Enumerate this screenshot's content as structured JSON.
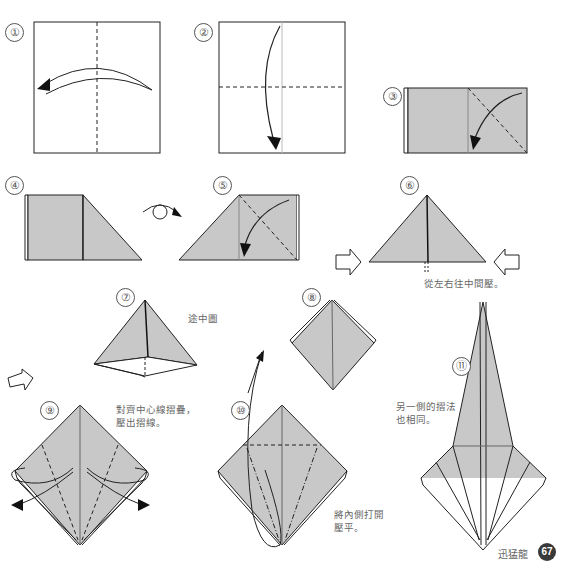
{
  "page": {
    "type": "origami instruction page",
    "paper_color": "#c8c8c8",
    "line_color": "#222222",
    "footer": {
      "title": "迅猛龍",
      "page_number": "67"
    }
  },
  "steps": [
    {
      "num": "①",
      "note": ""
    },
    {
      "num": "②",
      "note": ""
    },
    {
      "num": "③",
      "note": ""
    },
    {
      "num": "④",
      "note": ""
    },
    {
      "num": "⑤",
      "note": ""
    },
    {
      "num": "⑥",
      "note": "從左右往中間壓。"
    },
    {
      "num": "⑦",
      "note": "途中圖"
    },
    {
      "num": "⑧",
      "note": ""
    },
    {
      "num": "⑨",
      "note_line1": "對齊中心線摺疊，",
      "note_line2": "壓出摺線。"
    },
    {
      "num": "⑩",
      "note_line1": "將內側打開",
      "note_line2": "壓平。"
    },
    {
      "num": "⑪",
      "note_line1": "另一側的摺法",
      "note_line2": "也相同。"
    }
  ]
}
